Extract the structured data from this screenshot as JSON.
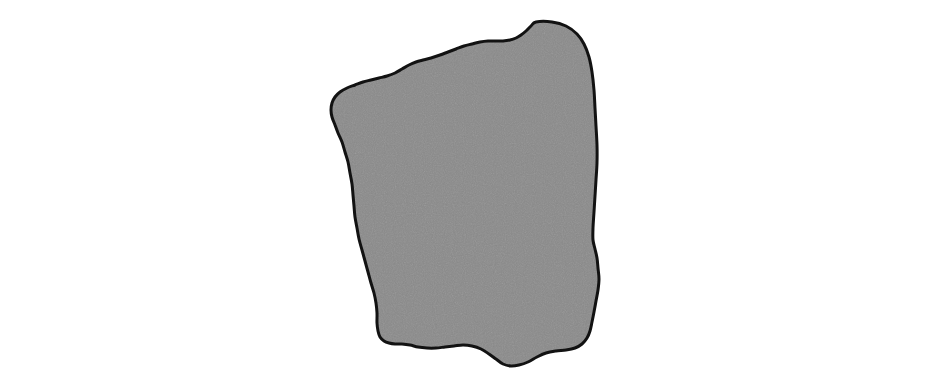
{
  "figure": {
    "title": "Irregular shaded blob figure",
    "canvas_width": 937,
    "canvas_height": 384,
    "background_color": "#ffffff",
    "frame": {
      "label": "figure border",
      "stroke_color": "#8d8f92",
      "stroke_width": 1,
      "x": 8,
      "y": 8,
      "width": 919,
      "height": 366
    },
    "shape": {
      "label": "irregular gray blob",
      "kind": "closed-freeform-polygon",
      "fill_color": "#8a8a8a",
      "fill_texture": "fine random noise",
      "stroke_color": "#121212",
      "stroke_width": 3,
      "bounds": {
        "x_min": 331,
        "y_min": 21,
        "x_max": 599,
        "y_max": 366,
        "width": 268,
        "height": 345
      },
      "outline_points": [
        [
          536,
          22
        ],
        [
          552,
          22
        ],
        [
          566,
          26
        ],
        [
          577,
          34
        ],
        [
          584,
          44
        ],
        [
          589,
          57
        ],
        [
          592,
          72
        ],
        [
          594,
          90
        ],
        [
          595,
          108
        ],
        [
          596,
          126
        ],
        [
          597,
          145
        ],
        [
          597,
          163
        ],
        [
          596,
          180
        ],
        [
          595,
          196
        ],
        [
          594,
          212
        ],
        [
          593,
          228
        ],
        [
          593,
          240
        ],
        [
          595,
          249
        ],
        [
          597,
          258
        ],
        [
          598,
          268
        ],
        [
          599,
          279
        ],
        [
          598,
          290
        ],
        [
          596,
          301
        ],
        [
          594,
          312
        ],
        [
          592,
          322
        ],
        [
          590,
          331
        ],
        [
          587,
          338
        ],
        [
          582,
          344
        ],
        [
          575,
          348
        ],
        [
          566,
          350
        ],
        [
          556,
          351
        ],
        [
          546,
          353
        ],
        [
          537,
          357
        ],
        [
          528,
          362
        ],
        [
          519,
          365
        ],
        [
          511,
          366
        ],
        [
          503,
          364
        ],
        [
          496,
          359
        ],
        [
          489,
          354
        ],
        [
          481,
          349
        ],
        [
          472,
          346
        ],
        [
          463,
          345
        ],
        [
          454,
          346
        ],
        [
          445,
          347
        ],
        [
          436,
          348
        ],
        [
          427,
          348
        ],
        [
          418,
          347
        ],
        [
          410,
          345
        ],
        [
          402,
          344
        ],
        [
          395,
          344
        ],
        [
          389,
          343
        ],
        [
          384,
          341
        ],
        [
          380,
          337
        ],
        [
          378,
          331
        ],
        [
          377,
          323
        ],
        [
          377,
          313
        ],
        [
          376,
          303
        ],
        [
          374,
          293
        ],
        [
          371,
          283
        ],
        [
          368,
          272
        ],
        [
          365,
          261
        ],
        [
          362,
          250
        ],
        [
          359,
          239
        ],
        [
          357,
          228
        ],
        [
          355,
          217
        ],
        [
          354,
          206
        ],
        [
          353,
          195
        ],
        [
          352,
          184
        ],
        [
          350,
          173
        ],
        [
          348,
          162
        ],
        [
          345,
          152
        ],
        [
          342,
          142
        ],
        [
          338,
          133
        ],
        [
          335,
          125
        ],
        [
          332,
          117
        ],
        [
          331,
          110
        ],
        [
          332,
          103
        ],
        [
          335,
          97
        ],
        [
          340,
          92
        ],
        [
          347,
          88
        ],
        [
          355,
          85
        ],
        [
          363,
          82
        ],
        [
          371,
          80
        ],
        [
          379,
          78
        ],
        [
          387,
          76
        ],
        [
          395,
          73
        ],
        [
          402,
          69
        ],
        [
          409,
          65
        ],
        [
          416,
          62
        ],
        [
          423,
          60
        ],
        [
          431,
          58
        ],
        [
          440,
          55
        ],
        [
          448,
          52
        ],
        [
          456,
          49
        ],
        [
          464,
          46
        ],
        [
          472,
          44
        ],
        [
          480,
          42
        ],
        [
          488,
          41
        ],
        [
          496,
          41
        ],
        [
          503,
          41
        ],
        [
          510,
          40
        ],
        [
          516,
          38
        ],
        [
          521,
          35
        ],
        [
          526,
          31
        ],
        [
          531,
          26
        ]
      ]
    }
  }
}
